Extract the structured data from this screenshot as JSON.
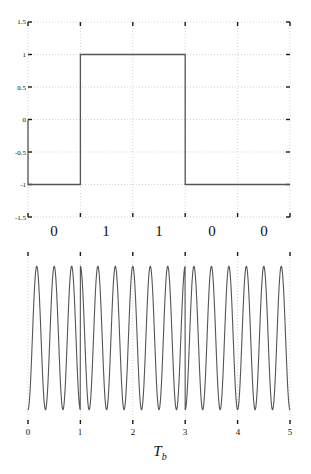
{
  "figure": {
    "background_color": "#ffffff",
    "line_color": "#555555",
    "grid_color": "#c8c8c8",
    "tick_color": "#1a1a1a"
  },
  "top_plot": {
    "y_tick_labels": [
      "1.5",
      "1",
      "0.5",
      "0",
      "-0.5",
      "-1",
      "-1.5"
    ],
    "y_tick_values": [
      1.5,
      1,
      0.5,
      0,
      -0.5,
      -1,
      -1.5
    ],
    "x_tick_values": [
      0,
      1,
      2,
      3,
      4,
      5
    ],
    "bit_labels": [
      "0",
      "1",
      "1",
      "0",
      "0"
    ]
  },
  "bottom_plot": {
    "x_tick_labels": [
      "0",
      "1",
      "2",
      "3",
      "4",
      "5"
    ],
    "x_tick_values": [
      0,
      1,
      2,
      3,
      4,
      5
    ],
    "x_axis_title": "T",
    "x_axis_title_sub": "b"
  },
  "chart_data": {
    "type": "line",
    "title": "",
    "panels": [
      {
        "name": "nrz-bipolar-data-signal",
        "type": "line",
        "xlabel": "",
        "ylabel": "",
        "xlim": [
          0,
          5
        ],
        "ylim": [
          -1.5,
          1.5
        ],
        "grid": true,
        "yticks": [
          -1.5,
          -1,
          -0.5,
          0,
          0.5,
          1,
          1.5
        ],
        "xticks": [
          0,
          1,
          2,
          3,
          4,
          5
        ],
        "bit_sequence": [
          0,
          1,
          1,
          0,
          0
        ],
        "bit_interval_labels": [
          "0",
          "1",
          "1",
          "0",
          "0"
        ],
        "series": [
          {
            "name": "bipolar NRZ square wave",
            "x": [
              0,
              0,
              1,
              1,
              3,
              3,
              5
            ],
            "values": [
              0,
              -1,
              -1,
              1,
              1,
              -1,
              -1
            ]
          }
        ]
      },
      {
        "name": "bpsk-modulated-carrier",
        "type": "line",
        "xlabel": "T_b",
        "ylabel": "",
        "xlim": [
          0,
          5
        ],
        "ylim": [
          -1.2,
          1.2
        ],
        "grid": true,
        "xticks": [
          0,
          1,
          2,
          3,
          4,
          5
        ],
        "series": [
          {
            "name": "BPSK carrier (3 cycles per bit, phase inverted for bit 0)",
            "description": "s(t) = d(t)*cos(2*pi*3*t) with d(t) = -1,+1,+1,-1,-1 over the five bit intervals",
            "carrier_cycles_per_bit": 3,
            "amplitude": 1,
            "phase_code": [
              -1,
              1,
              1,
              -1,
              -1
            ]
          }
        ]
      }
    ]
  }
}
